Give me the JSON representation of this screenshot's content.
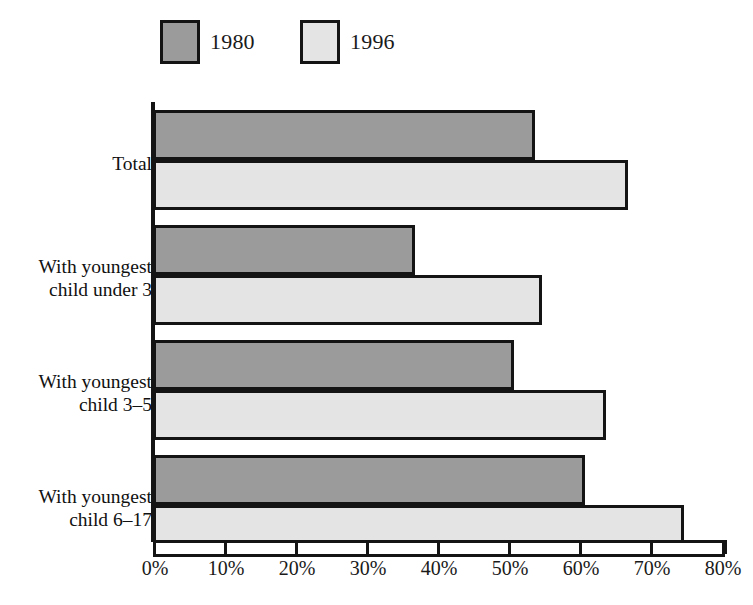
{
  "chart_data": {
    "type": "bar",
    "orientation": "horizontal",
    "title": "",
    "subtitle": "",
    "xlabel": "",
    "ylabel": "",
    "xlim": [
      0,
      80
    ],
    "xtick_labels": [
      "0%",
      "10%",
      "20%",
      "30%",
      "40%",
      "50%",
      "60%",
      "70%",
      "80%"
    ],
    "xtick_values": [
      0,
      10,
      20,
      30,
      40,
      50,
      60,
      70,
      80
    ],
    "grid": false,
    "legend_position": "top-left",
    "categories": [
      "Total",
      "With youngest child under 3",
      "With youngest child 3–5",
      "With youngest child 6–17"
    ],
    "category_lines": [
      [
        "Total"
      ],
      [
        "With youngest",
        "child under 3"
      ],
      [
        "With youngest",
        "child 3–5"
      ],
      [
        "With youngest",
        "child 6–17"
      ]
    ],
    "series": [
      {
        "name": "1980",
        "color": "#9b9b9b",
        "values": [
          53,
          36,
          50,
          60
        ]
      },
      {
        "name": "1996",
        "color": "#e4e4e4",
        "values": [
          66,
          54,
          63,
          74
        ]
      }
    ]
  },
  "legend": {
    "items": [
      {
        "label": "1980",
        "swatch": "dark-gray-swatch"
      },
      {
        "label": "1996",
        "swatch": "light-gray-swatch"
      }
    ]
  },
  "colors": {
    "series_1980": "#9b9b9b",
    "series_1996": "#e4e4e4",
    "outline": "#141414",
    "background": "#ffffff",
    "text": "#1a1a1a"
  }
}
